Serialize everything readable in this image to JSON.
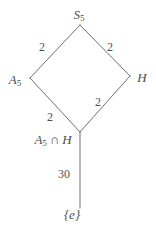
{
  "diagram": {
    "kind": "subgroup-lattice",
    "colors": {
      "background": "#ffffff",
      "line": "#6f6f6f",
      "text": "#4f4f4f"
    },
    "nodes": {
      "top": {
        "base": "S",
        "sub": "5"
      },
      "left": {
        "base": "A",
        "sub": "5"
      },
      "right": {
        "base": "H"
      },
      "meet": {
        "a_base": "A",
        "a_sub": "5",
        "op": "∩",
        "b": "H"
      },
      "bottom": {
        "label": "{e}"
      }
    },
    "edge_labels": {
      "top_to_left": "2",
      "top_to_right": "2",
      "left_to_meet": "2",
      "right_to_meet": "2",
      "meet_to_bottom": "30"
    }
  }
}
